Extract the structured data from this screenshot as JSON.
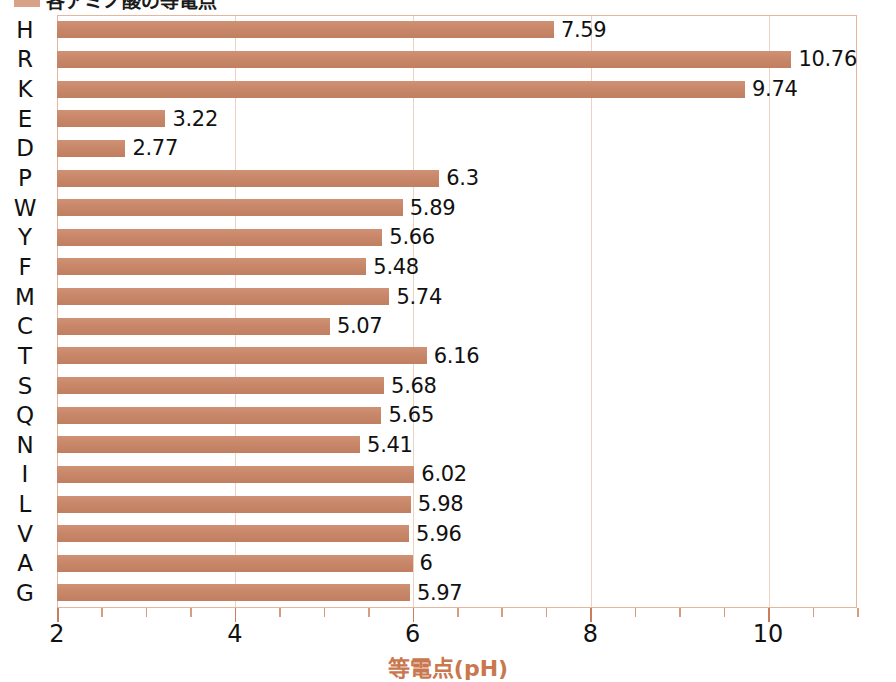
{
  "legend": {
    "label": "各アミノ酸の等電点",
    "swatch_color": "#d8a288"
  },
  "colors": {
    "bar": "#c9876a",
    "border": "#e6b59c",
    "gridline": "#edd2c2",
    "axis_title": "#c9774e",
    "tick": "#c97f5c"
  },
  "chart_data": {
    "type": "bar",
    "orientation": "horizontal",
    "title": "各アミノ酸の等電点",
    "xlabel": "等電点(pH)",
    "ylabel": "",
    "xlim": [
      2,
      11
    ],
    "xticks": [
      2,
      4,
      6,
      8,
      10
    ],
    "xtick_labels": [
      "2",
      "4",
      "6",
      "8",
      "10"
    ],
    "minor_tick_step": 0.5,
    "grid": true,
    "grid_axis": "x",
    "legend_position": "top-left",
    "categories": [
      "H",
      "R",
      "K",
      "E",
      "D",
      "P",
      "W",
      "Y",
      "F",
      "M",
      "C",
      "T",
      "S",
      "Q",
      "N",
      "I",
      "L",
      "V",
      "A",
      "G"
    ],
    "values": [
      7.59,
      10.76,
      9.74,
      3.22,
      2.77,
      6.3,
      5.89,
      5.66,
      5.48,
      5.74,
      5.07,
      6.16,
      5.68,
      5.65,
      5.41,
      6.02,
      5.98,
      5.96,
      6,
      5.97
    ],
    "value_labels": [
      "7.59",
      "10.76",
      "9.74",
      "3.22",
      "2.77",
      "6.3",
      "5.89",
      "5.66",
      "5.48",
      "5.74",
      "5.07",
      "6.16",
      "5.68",
      "5.65",
      "5.41",
      "6.02",
      "5.98",
      "5.96",
      "6",
      "5.97"
    ],
    "series": [
      {
        "name": "各アミノ酸の等電点",
        "values": [
          7.59,
          10.76,
          9.74,
          3.22,
          2.77,
          6.3,
          5.89,
          5.66,
          5.48,
          5.74,
          5.07,
          6.16,
          5.68,
          5.65,
          5.41,
          6.02,
          5.98,
          5.96,
          6,
          5.97
        ]
      }
    ]
  }
}
